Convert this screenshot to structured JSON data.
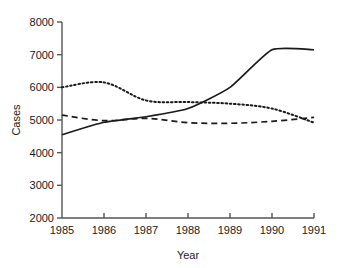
{
  "chart_data": {
    "type": "line",
    "title": "",
    "xlabel": "Year",
    "ylabel": "Cases",
    "x": [
      1985,
      1986,
      1987,
      1988,
      1989,
      1990,
      1991
    ],
    "xticklabels": [
      "1985",
      "1986",
      "1987",
      "1988",
      "1989",
      "1990",
      "1991"
    ],
    "yticklabels": [
      "2000",
      "3000",
      "4000",
      "5000",
      "6000",
      "7000",
      "8000"
    ],
    "yticks": [
      2000,
      3000,
      4000,
      5000,
      6000,
      7000,
      8000
    ],
    "xlim": [
      1985,
      1991
    ],
    "ylim": [
      2000,
      8000
    ],
    "grid": false,
    "legend": "none",
    "series": [
      {
        "name": "solid-series",
        "style": "solid",
        "color": "#1a1a1a",
        "values": [
          4550,
          4930,
          5100,
          5350,
          6000,
          7150,
          7150
        ]
      },
      {
        "name": "dotted-series",
        "style": "dotted",
        "color": "#1a1a1a",
        "values": [
          6000,
          6150,
          5600,
          5550,
          5500,
          5350,
          4920
        ]
      },
      {
        "name": "dashed-series",
        "style": "dashed",
        "color": "#1a1a1a",
        "values": [
          5150,
          4980,
          5050,
          4920,
          4900,
          4960,
          5080
        ]
      }
    ]
  }
}
